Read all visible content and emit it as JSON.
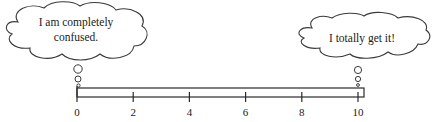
{
  "scale": {
    "min": 0,
    "max": 10,
    "ticks": [
      0,
      2,
      4,
      6,
      8,
      10
    ],
    "tick_labels": [
      "0",
      "2",
      "4",
      "6",
      "8",
      "10"
    ]
  },
  "left_thought": {
    "anchor_value": 0,
    "lines": [
      "I am completely",
      "confused."
    ]
  },
  "right_thought": {
    "anchor_value": 10,
    "lines": [
      "I totally get it!"
    ]
  }
}
